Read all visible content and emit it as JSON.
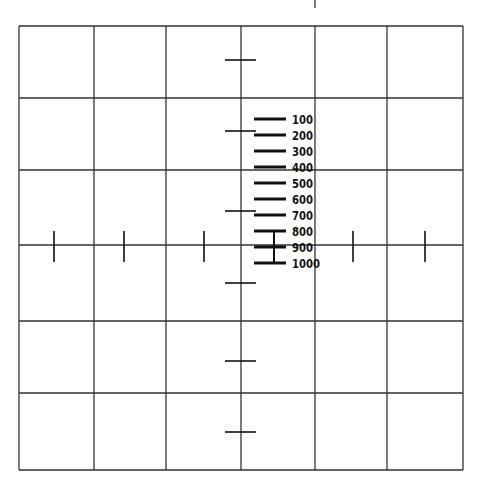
{
  "reticle": {
    "grid": {
      "x_lines": [
        19,
        94,
        166,
        241,
        315,
        387,
        463
      ],
      "y_lines": [
        26,
        98,
        170,
        245,
        321,
        393,
        470
      ],
      "line_color": "#333333"
    },
    "center": {
      "x": 241,
      "y": 245
    },
    "vertical_ticks_on_horizontal_axis": [
      54,
      124,
      204,
      353,
      425
    ],
    "horizontal_ticks_on_vertical_axis": [
      60,
      131,
      211,
      283,
      361,
      432
    ],
    "top_tick": {
      "x": 315,
      "y1": 0,
      "y2": 8
    },
    "range_scale": {
      "bar_x1": 254,
      "bar_x2": 286,
      "label_x": 292,
      "connector_x": 274,
      "marks": [
        {
          "label": "100",
          "y": 119
        },
        {
          "label": "200",
          "y": 135
        },
        {
          "label": "300",
          "y": 151
        },
        {
          "label": "400",
          "y": 167
        },
        {
          "label": "500",
          "y": 183
        },
        {
          "label": "600",
          "y": 199
        },
        {
          "label": "700",
          "y": 215
        },
        {
          "label": "800",
          "y": 231
        },
        {
          "label": "900",
          "y": 247
        },
        {
          "label": "1000",
          "y": 263
        }
      ]
    }
  }
}
